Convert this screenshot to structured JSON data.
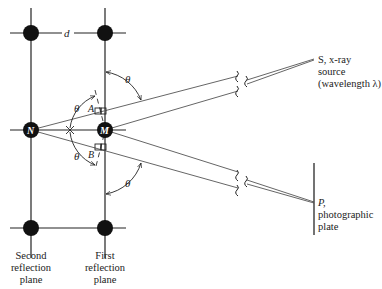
{
  "diagram": {
    "spacing_label": "d",
    "atoms": {
      "N": "N",
      "M": "M"
    },
    "points": {
      "A": "A",
      "B": "B"
    },
    "angle_label": "θ",
    "source": {
      "line1": "S, x-ray",
      "line2": "source",
      "line3": "(wavelength λ)"
    },
    "plate": {
      "line1": "P,",
      "line2": "photographic",
      "line3": "plate"
    },
    "planes": {
      "second": [
        "Second",
        "reflection",
        "plane"
      ],
      "first": [
        "First",
        "reflection",
        "plane"
      ]
    },
    "colors": {
      "line": "#222222",
      "ray": "#555555",
      "atom": "#111111",
      "background": "#ffffff"
    }
  }
}
